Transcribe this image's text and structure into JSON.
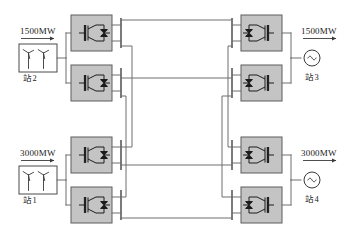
{
  "figure": {
    "type": "single-line-diagram",
    "colors": {
      "converter_fill": "#c4c4c4",
      "converter_stroke": "#5c5c5c",
      "wire": "#6f6f6f",
      "bus": "#5a5a5a",
      "text": "#222222",
      "background": "#ffffff"
    }
  },
  "sources": [
    {
      "id": "farm-top",
      "power_label": "1500MW",
      "station_label": "站2",
      "icon": "wind-turbine-icon",
      "turbine_count": 2,
      "flow_direction": "right"
    },
    {
      "id": "farm-bottom",
      "power_label": "3000MW",
      "station_label": "站1",
      "icon": "wind-turbine-icon",
      "turbine_count": 2,
      "flow_direction": "right"
    }
  ],
  "loads": [
    {
      "id": "grid-top",
      "power_label": "1500MW",
      "station_label": "站3",
      "icon": "ac-source-icon",
      "flow_direction": "right"
    },
    {
      "id": "grid-bottom",
      "power_label": "3000MW",
      "station_label": "站4",
      "icon": "ac-source-icon",
      "flow_direction": "right"
    }
  ],
  "converters": {
    "icon_left": "igbt-converter-icon",
    "icon_right": "igbt-converter-icon-mirrored",
    "count": 8,
    "left_column": [
      {
        "id": "conv-L1",
        "row": 1
      },
      {
        "id": "conv-L2",
        "row": 2
      },
      {
        "id": "conv-L3",
        "row": 3
      },
      {
        "id": "conv-L4",
        "row": 4
      }
    ],
    "right_column": [
      {
        "id": "conv-R1",
        "row": 1
      },
      {
        "id": "conv-R2",
        "row": 2
      },
      {
        "id": "conv-R3",
        "row": 3
      },
      {
        "id": "conv-R4",
        "row": 4
      }
    ]
  },
  "dc_buses": {
    "left_bus_count": 4,
    "right_bus_count": 4,
    "description": "vertical DC bus bars on each side linked by horizontal DC transmission lines"
  }
}
